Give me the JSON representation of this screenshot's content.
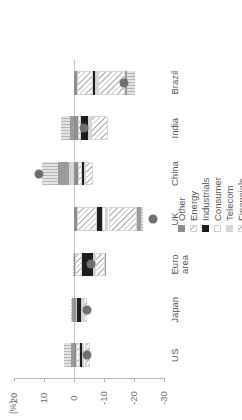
{
  "chart_data": {
    "type": "bar",
    "title": "",
    "subtitle": "",
    "xlabel": "",
    "ylabel": "(%)",
    "stacked": true,
    "orientation": "vertical",
    "grid": false,
    "legend_position": "right",
    "ylim": [
      -30,
      20
    ],
    "yticks": [
      20,
      10,
      0,
      -10,
      -20,
      -30
    ],
    "ytick_labels": [
      "20",
      "10",
      "0",
      "-10",
      "-20",
      "-30"
    ],
    "categories": [
      "US",
      "Japan",
      "Euro\narea",
      "UK",
      "China",
      "India",
      "Brazil"
    ],
    "category_labels": [
      {
        "line1": "US",
        "line2": ""
      },
      {
        "line1": "Japan",
        "line2": ""
      },
      {
        "line1": "Euro",
        "line2": "area"
      },
      {
        "line1": "UK",
        "line2": ""
      },
      {
        "line1": "China",
        "line2": ""
      },
      {
        "line1": "India",
        "line2": ""
      },
      {
        "line1": "Brazil",
        "line2": ""
      }
    ],
    "series": [
      {
        "name": "Other",
        "fill": "f-other",
        "values": [
          -0.6,
          -0.5,
          -0.4,
          -1.0,
          -1.4,
          -1.2,
          -0.9
        ]
      },
      {
        "name": "Energy",
        "fill": "f-energy",
        "values": [
          -1.4,
          -0.5,
          -2.2,
          -6.8,
          -1.2,
          -1.0,
          -5.4
        ]
      },
      {
        "name": "Industrials",
        "fill": "f-industrials",
        "values": [
          -0.8,
          -1.2,
          -3.6,
          -1.6,
          -0.6,
          -2.4,
          -0.7
        ]
      },
      {
        "name": "Consumer",
        "fill": "f-consumer",
        "values": [
          -0.7,
          -0.6,
          -0.5,
          -1.2,
          -0.4,
          -0.5,
          -0.4
        ]
      },
      {
        "name": "Telecom",
        "fill": "f-telecom",
        "values": [
          -0.5,
          -0.4,
          -0.3,
          -0.9,
          1.8,
          -0.6,
          -0.5
        ]
      },
      {
        "name": "Financials",
        "fill": "f-financials",
        "values": [
          -1.2,
          -1.0,
          -3.4,
          -9.5,
          -2.6,
          -5.8,
          -9.2
        ]
      },
      {
        "name": "Healthcare",
        "fill": "f-healthcare",
        "values": [
          1.1,
          0.6,
          -0.3,
          -1.4,
          3.6,
          1.4,
          -0.6
        ]
      },
      {
        "name": "Information technology",
        "fill": "f-infotech",
        "values": [
          2.1,
          0.4,
          0.5,
          -0.6,
          5.4,
          3.1,
          -2.6
        ]
      }
    ],
    "overlay": {
      "name": "Overall performance (YTD)",
      "type": "scatter",
      "marker": "circle",
      "color": "#6f6f6f",
      "values": [
        -4.2,
        -4.4,
        -5.6,
        -26.2,
        11.8,
        -3.2,
        -16.8
      ]
    },
    "legend": [
      {
        "label": "Other",
        "fill": "f-other",
        "shape": "square"
      },
      {
        "label": "Energy",
        "fill": "f-energy",
        "shape": "square"
      },
      {
        "label": "Industrials",
        "fill": "f-industrials",
        "shape": "square"
      },
      {
        "label": "Consumer",
        "fill": "f-consumer",
        "shape": "square"
      },
      {
        "label": "Telecom",
        "fill": "f-telecom",
        "shape": "square"
      },
      {
        "label": "Financials",
        "fill": "f-financials",
        "shape": "square"
      },
      {
        "label": "Healthcare",
        "fill": "f-healthcare",
        "shape": "square"
      },
      {
        "label": "Information technology",
        "fill": "f-infotech",
        "shape": "square"
      },
      {
        "label": "Overall performance (YTD)",
        "fill": "f-overall",
        "shape": "circle"
      }
    ]
  }
}
